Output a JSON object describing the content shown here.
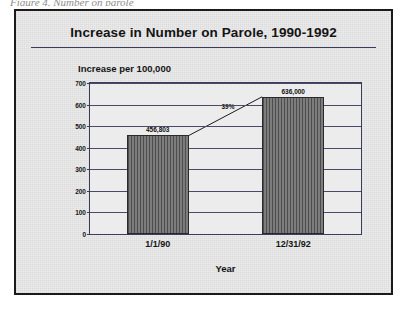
{
  "scan": {
    "artifact_text": "Figure 4. Number on parole"
  },
  "chart_data": {
    "type": "bar",
    "title": "Increase in Number on Parole, 1990-1992",
    "xlabel": "Year",
    "ylabel": "Increase per 100,000",
    "categories": [
      "1/1/90",
      "12/31/92"
    ],
    "values": [
      456803,
      636000
    ],
    "value_labels": [
      "456,803",
      "636,000"
    ],
    "ylim": [
      0,
      700
    ],
    "yticks": [
      0,
      100,
      200,
      300,
      400,
      500,
      600,
      700
    ],
    "ytick_labels": [
      "0",
      "100",
      "200",
      "300",
      "400",
      "500",
      "600",
      "700"
    ],
    "grid": true,
    "legend": "none",
    "annotations": [
      {
        "name": "percent-increase",
        "text": "39%",
        "from_category": "1/1/90",
        "to_category": "12/31/92"
      }
    ],
    "series_color": "#6e6e6e",
    "axis_color": "#3b3b5c",
    "background_color": "#ececec"
  }
}
